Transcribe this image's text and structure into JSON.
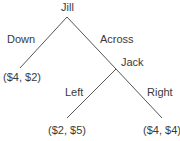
{
  "diagram": {
    "type": "game-tree",
    "nodes": {
      "root": {
        "player": "Jill"
      },
      "second": {
        "player": "Jack"
      }
    },
    "edges": {
      "down": {
        "label": "Down"
      },
      "across": {
        "label": "Across"
      },
      "left": {
        "label": "Left"
      },
      "right": {
        "label": "Right"
      }
    },
    "payoffs": {
      "down": "($4, $2)",
      "left": "($2, $5)",
      "right": "($4, $4)"
    },
    "line_color": "#555555"
  }
}
